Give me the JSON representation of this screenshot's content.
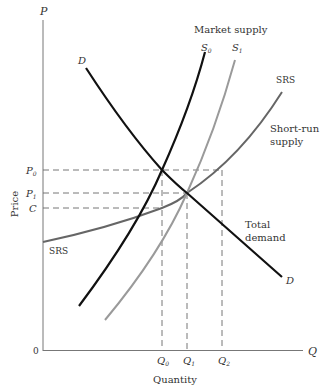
{
  "diagram": {
    "type": "economics-supply-demand",
    "axes": {
      "y_symbol": "P",
      "x_symbol": "Q",
      "origin": "0",
      "y_title": "Price",
      "x_title": "Quantity"
    },
    "price_levels": {
      "p0": {
        "label": "P",
        "sub": "0"
      },
      "p1": {
        "label": "P",
        "sub": "1"
      },
      "c": {
        "label": "C",
        "sub": ""
      }
    },
    "quantity_levels": {
      "q0": {
        "label": "Q",
        "sub": "0"
      },
      "q1": {
        "label": "Q",
        "sub": "1"
      },
      "q2": {
        "label": "Q",
        "sub": "2"
      }
    },
    "curves": {
      "demand": {
        "label_top": "D",
        "label_bottom": "D",
        "caption_line1": "Total",
        "caption_line2": "demand",
        "color": "#111111"
      },
      "s0": {
        "label": "S",
        "sub": "0",
        "color": "#111111"
      },
      "s1": {
        "label": "S",
        "sub": "1",
        "color": "#9a9a9a"
      },
      "srs": {
        "label_top": "SRS",
        "label_left": "SRS",
        "caption_line1": "Short-run",
        "caption_line2": "supply",
        "color": "#666666"
      },
      "market_supply_caption": "Market supply"
    }
  }
}
